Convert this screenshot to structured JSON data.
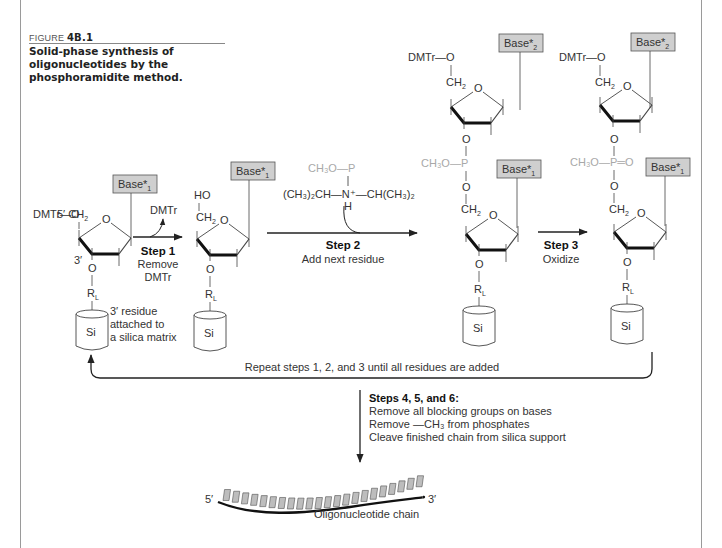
{
  "figure": {
    "label_prefix": "FIGURE",
    "label_number": "4B.1",
    "caption": "Solid-phase synthesis of oligonucleotides by the phosphoramidite method."
  },
  "labels": {
    "dmtr_o": "DMTr—O",
    "five_prime_ch2": "5′ CH",
    "ch2": "CH",
    "sub2": "2",
    "ring_o": "O",
    "three_prime": "3′",
    "o": "O",
    "rl": "R",
    "rl_sub": "L",
    "si": "Si",
    "ho": "HO",
    "base1": "Base*",
    "base1_sub": "1",
    "base2": "Base*",
    "base2_sub": "2",
    "ch3o_p": "CH₃O—P",
    "ch3o_p_dbl": "CH₃O—P═O",
    "amine": "(CH₃)₂CH—N⁺—CH(CH₃)₂",
    "amine_h": "H",
    "residue_note": [
      "3′ residue",
      "attached to",
      "a silica matrix"
    ],
    "dmtr_leaving": "DMTr"
  },
  "steps": [
    {
      "title": "Step 1",
      "lines": [
        "Remove",
        "DMTr"
      ]
    },
    {
      "title": "Step 2",
      "lines": [
        "Add next residue"
      ]
    },
    {
      "title": "Step 3",
      "lines": [
        "Oxidize"
      ]
    }
  ],
  "repeat_text": "Repeat steps 1, 2, and 3 until all residues are added",
  "final_steps": {
    "title": "Steps 4, 5, and 6:",
    "lines": [
      "Remove all blocking groups on bases",
      "Remove —CH₃ from phosphates",
      "Cleave finished chain from silica support"
    ]
  },
  "chain": {
    "five_prime": "5′",
    "three_prime": "3′",
    "label": "Oligonucleotide chain",
    "base_count": 22
  },
  "colors": {
    "base_box_fill": "#cfcfcf",
    "phosphate_gray": "#a8a8a8",
    "line": "#444444"
  }
}
